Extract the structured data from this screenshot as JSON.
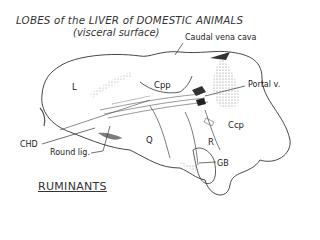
{
  "title": "LOBES of the LIVER of DOMESTIC ANIMALS",
  "subtitle": "(visceral surface)",
  "labels": {
    "caudal_vena_cava": "Caudal vena cava",
    "portal_vein": "Portal v.",
    "chd": "CHD",
    "round_lig": "Round lig.",
    "gb": "GB"
  },
  "lobes": {
    "left": "L",
    "caudate_papillary": "Cpp",
    "quadrate": "Q",
    "right": "R",
    "caudate_process": "Ccp"
  },
  "footer": "RUMINANTS"
}
